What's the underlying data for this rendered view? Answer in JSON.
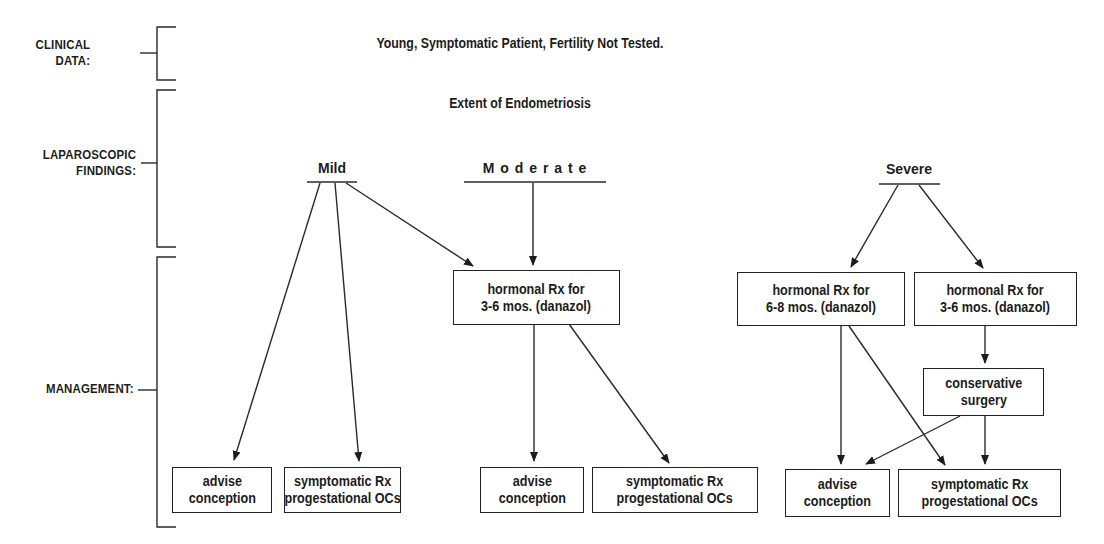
{
  "side_labels": {
    "clinical": [
      "CLINICAL",
      "DATA:"
    ],
    "laparoscopic": [
      "LAPAROSCOPIC",
      "FINDINGS:"
    ],
    "management": "MANAGEMENT:"
  },
  "clinical_data": "Young, Symptomatic Patient, Fertility Not Tested.",
  "findings_title": "Extent of Endometriosis",
  "categories": {
    "mild": "Mild",
    "moderate": "M o d e r a t e",
    "severe": "Severe"
  },
  "nodes": {
    "mild_advise": [
      "advise",
      "conception"
    ],
    "mild_symptomatic": [
      "symptomatic Rx",
      "progestational OCs"
    ],
    "moderate_hormonal": [
      "hormonal Rx for",
      "3-6 mos.  (danazol)"
    ],
    "moderate_advise": [
      "advise",
      "conception"
    ],
    "moderate_symptomatic": [
      "symptomatic Rx",
      "progestational OCs"
    ],
    "severe_hormonal_long": [
      "hormonal Rx for",
      "6-8 mos. (danazol)"
    ],
    "severe_hormonal_short": [
      "hormonal Rx for",
      "3-6 mos. (danazol)"
    ],
    "severe_surgery": [
      "conservative",
      "surgery"
    ],
    "severe_advise": [
      "advise",
      "conception"
    ],
    "severe_symptomatic": [
      "symptomatic Rx",
      "progestational OCs"
    ]
  },
  "edges": [
    {
      "from": "Mild",
      "to": "mild_advise"
    },
    {
      "from": "Mild",
      "to": "mild_symptomatic"
    },
    {
      "from": "Mild",
      "to": "moderate_hormonal"
    },
    {
      "from": "Moderate",
      "to": "moderate_hormonal"
    },
    {
      "from": "moderate_hormonal",
      "to": "moderate_advise"
    },
    {
      "from": "moderate_hormonal",
      "to": "moderate_symptomatic"
    },
    {
      "from": "Severe",
      "to": "severe_hormonal_long"
    },
    {
      "from": "Severe",
      "to": "severe_hormonal_short"
    },
    {
      "from": "severe_hormonal_short",
      "to": "severe_surgery"
    },
    {
      "from": "severe_hormonal_long",
      "to": "severe_advise"
    },
    {
      "from": "severe_hormonal_long",
      "to": "severe_symptomatic"
    },
    {
      "from": "severe_surgery",
      "to": "severe_advise"
    },
    {
      "from": "severe_surgery",
      "to": "severe_symptomatic"
    }
  ]
}
